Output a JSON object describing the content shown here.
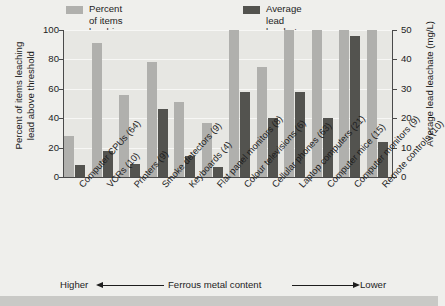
{
  "legend": {
    "entries": [
      {
        "label": "Percent of items leaching\nlead above threshold",
        "color": "#b0b0ad",
        "name": "legend-percent"
      },
      {
        "label": "Average lead leachate (mg/L)",
        "color": "#53534f",
        "name": "legend-leachate"
      }
    ]
  },
  "axes": {
    "left_title": "Percent of items leaching\nlead above threshold",
    "right_title": "Average lead leachate (mg/L)",
    "left_ticks": [
      "0",
      "20",
      "40",
      "60",
      "80",
      "100"
    ],
    "right_ticks": [
      "0",
      "10",
      "20",
      "30",
      "40",
      "50"
    ]
  },
  "footer": {
    "left_label": "Higher",
    "center_label": "Ferrous metal content",
    "right_label": "Lower"
  },
  "chart_data": {
    "type": "bar",
    "title": "",
    "xlabel": "Ferrous metal content",
    "ylabel": "Percent of items leaching lead above threshold",
    "ylabel_secondary": "Average lead leachate (mg/L)",
    "ylim": [
      0,
      100
    ],
    "ylim_secondary": [
      0,
      50
    ],
    "ytick_step": 20,
    "ytick_step_secondary": 10,
    "grid": true,
    "legend_position": "top",
    "orientation": "vertical",
    "categories": [
      "Computer CPUs (64)",
      "VCRs (10)",
      "Printers (9)",
      "Smoke detectors (9)",
      "Keyboards (4)",
      "Flat panel monitors (8)",
      "Colour televisions (6)",
      "Cellular phones (63)",
      "Laptop computers (21)",
      "Computer mice (15)",
      "Computer monitors (9)",
      "Remote controls (10)"
    ],
    "series": [
      {
        "name": "Percent of items leaching lead above threshold",
        "axis": "left",
        "unit": "%",
        "color": "#b0b0ad",
        "values": [
          28,
          91,
          56,
          78,
          51,
          37,
          100,
          75,
          100,
          100,
          100,
          100
        ]
      },
      {
        "name": "Average lead leachate (mg/L)",
        "axis": "right",
        "unit": "mg/L",
        "color": "#53534f",
        "values": [
          4,
          9,
          4.5,
          23,
          7,
          3.5,
          29,
          20,
          29,
          20,
          48,
          12
        ]
      }
    ]
  }
}
